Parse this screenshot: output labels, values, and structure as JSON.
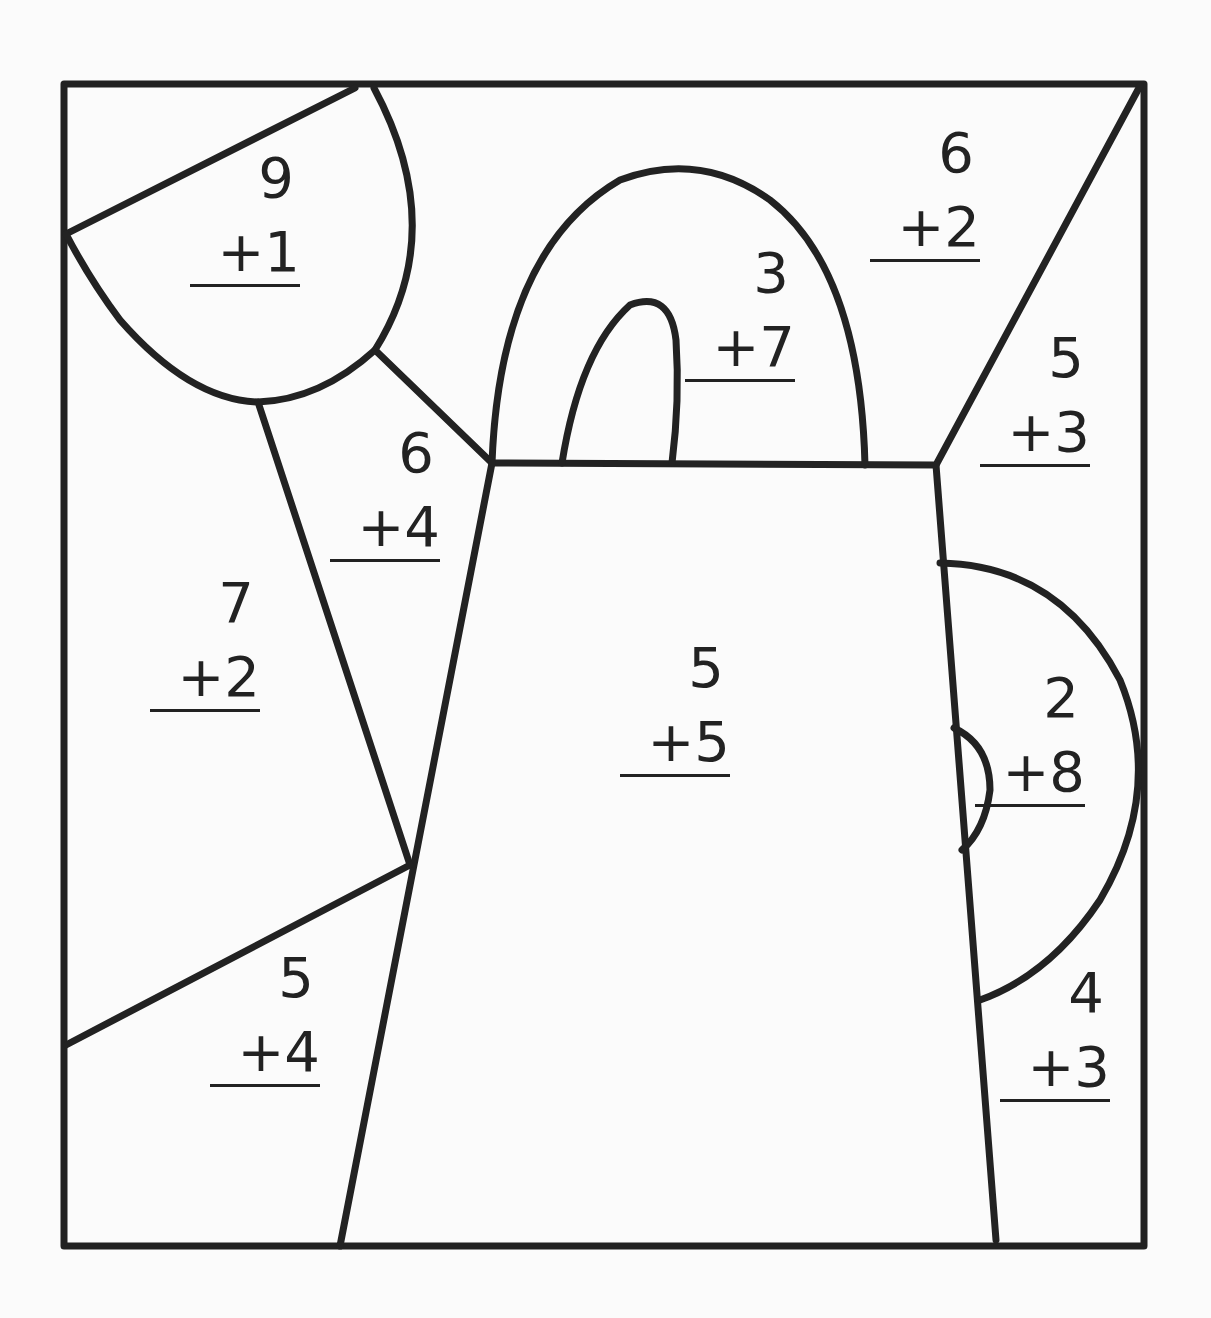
{
  "worksheet": {
    "type": "color-by-number addition",
    "problems": [
      {
        "region": "sun",
        "top": "9",
        "addend": "+1",
        "x": 190,
        "y": 150
      },
      {
        "region": "sky-top-right",
        "top": "6",
        "addend": "+2",
        "x": 870,
        "y": 125
      },
      {
        "region": "handle",
        "top": "3",
        "addend": "+7",
        "x": 685,
        "y": 245
      },
      {
        "region": "right-upper",
        "top": "5",
        "addend": "+3",
        "x": 980,
        "y": 330
      },
      {
        "region": "sun-ray",
        "top": "6",
        "addend": "+4",
        "x": 330,
        "y": 425
      },
      {
        "region": "left-middle",
        "top": "7",
        "addend": "+2",
        "x": 150,
        "y": 575
      },
      {
        "region": "pitcher-body",
        "top": "5",
        "addend": "+5",
        "x": 620,
        "y": 640
      },
      {
        "region": "spout",
        "top": "2",
        "addend": "+8",
        "x": 975,
        "y": 670
      },
      {
        "region": "bottom-left",
        "top": "5",
        "addend": "+4",
        "x": 210,
        "y": 950
      },
      {
        "region": "bottom-right",
        "top": "4",
        "addend": "+3",
        "x": 1000,
        "y": 965
      }
    ]
  }
}
